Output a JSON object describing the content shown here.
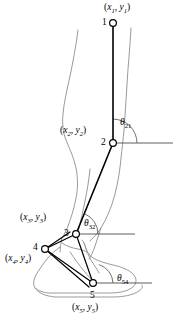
{
  "colors": {
    "link": "#000000",
    "silhouette": "#9a9a9a",
    "axis": "#4d4d4d",
    "joint_fill": "#ffffff",
    "background": "#ffffff"
  },
  "joints": [
    {
      "id": "1",
      "number": "1",
      "name": "hip",
      "number_label": "1",
      "coord_label_prefix": "(",
      "coord_label": "(x₁, y₁)",
      "x_symbol": "x",
      "y_symbol": "y",
      "subscript": "1",
      "cx": 113,
      "cy": 23
    },
    {
      "id": "2",
      "number": "2",
      "name": "knee",
      "number_label": "2",
      "coord_label": "(x₂, y₂)",
      "x_symbol": "x",
      "y_symbol": "y",
      "subscript": "2",
      "cx": 113,
      "cy": 143
    },
    {
      "id": "3",
      "number": "3",
      "name": "ankle",
      "number_label": "3",
      "coord_label": "(x₃, y₃)",
      "x_symbol": "x",
      "y_symbol": "y",
      "subscript": "3",
      "cx": 76,
      "cy": 234
    },
    {
      "id": "4",
      "number": "4",
      "name": "heel",
      "number_label": "4",
      "coord_label": "(x₄, y₄)",
      "x_symbol": "x",
      "y_symbol": "y",
      "subscript": "4",
      "cx": 45,
      "cy": 249
    },
    {
      "id": "5",
      "number": "5",
      "name": "toe",
      "number_label": "5",
      "coord_label": "(x₅, y₅)",
      "x_symbol": "x",
      "y_symbol": "y",
      "subscript": "5",
      "cx": 93,
      "cy": 283
    }
  ],
  "angles": [
    {
      "id": "theta21",
      "symbol": "θ",
      "subscript": "21",
      "label": "θ₂₁",
      "at_joint": "2",
      "description": "thigh angle relative to horizontal at the knee"
    },
    {
      "id": "theta32",
      "symbol": "θ",
      "subscript": "32",
      "label": "θ₃₂",
      "at_joint": "3",
      "description": "shank angle relative to horizontal at the ankle"
    },
    {
      "id": "theta54",
      "symbol": "θ",
      "subscript": "54",
      "label": "θ₅₄",
      "at_joint": "5",
      "description": "foot angle relative to horizontal at the toe"
    }
  ],
  "segments": [
    {
      "id": "thigh",
      "from": "1",
      "to": "2",
      "name": "thigh-segment"
    },
    {
      "id": "shank",
      "from": "2",
      "to": "3",
      "name": "shank-segment"
    },
    {
      "id": "heel-link",
      "from": "3",
      "to": "4",
      "name": "ankle-heel-segment"
    },
    {
      "id": "toe-link",
      "from": "3",
      "to": "5",
      "name": "ankle-toe-segment"
    },
    {
      "id": "foot-base",
      "from": "4",
      "to": "5",
      "name": "heel-toe-segment"
    }
  ],
  "labels": {
    "coord_1": "(x₁, y₁)",
    "coord_2": "(x₂, y₂)",
    "coord_3": "(x₃, y₃)",
    "coord_4": "(x₄, y₄)",
    "coord_5": "(x₅, y₅)",
    "joint_1": "1",
    "joint_2": "2",
    "joint_3": "3",
    "joint_4": "4",
    "joint_5": "5",
    "theta_21_sub": "21",
    "theta_32_sub": "32",
    "theta_54_sub": "54",
    "theta_symbol": "θ",
    "x_symbol": "x",
    "y_symbol": "y",
    "open_paren": "(",
    "comma": ",",
    "close_paren": ")",
    "sub_1": "1",
    "sub_2": "2",
    "sub_3": "3",
    "sub_4": "4",
    "sub_5": "5"
  }
}
